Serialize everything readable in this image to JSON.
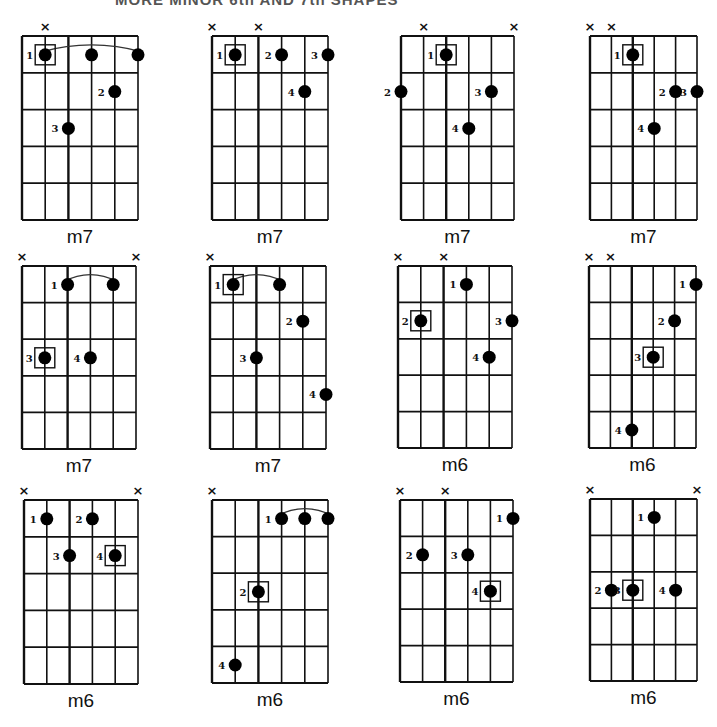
{
  "title": "MORE MINOR 6th AND 7th SHAPES",
  "layout": {
    "strings": 6,
    "frets": 5
  },
  "chords": [
    {
      "name": "m7",
      "x": 22,
      "y": 36,
      "w": 116,
      "h": 184,
      "muted": [
        1
      ],
      "notes": [
        {
          "s": 1,
          "f": 1,
          "finger": "1",
          "root": true
        },
        {
          "s": 3,
          "f": 1,
          "finger": ""
        },
        {
          "s": 5,
          "f": 1,
          "finger": ""
        },
        {
          "s": 4,
          "f": 2,
          "finger": "2"
        },
        {
          "s": 2,
          "f": 3,
          "finger": "3"
        }
      ],
      "barre": {
        "from": 1,
        "to": 5,
        "f": 1
      }
    },
    {
      "name": "m7",
      "x": 212,
      "y": 36,
      "w": 116,
      "h": 184,
      "muted": [
        0,
        2
      ],
      "notes": [
        {
          "s": 1,
          "f": 1,
          "finger": "1",
          "root": true
        },
        {
          "s": 3,
          "f": 1,
          "finger": "2"
        },
        {
          "s": 5,
          "f": 1,
          "finger": "3"
        },
        {
          "s": 4,
          "f": 2,
          "finger": "4"
        }
      ]
    },
    {
      "name": "m7",
      "x": 401,
      "y": 36,
      "w": 113,
      "h": 184,
      "muted": [
        1,
        5
      ],
      "notes": [
        {
          "s": 2,
          "f": 1,
          "finger": "1",
          "root": true
        },
        {
          "s": 0,
          "f": 2,
          "finger": "2"
        },
        {
          "s": 4,
          "f": 2,
          "finger": "3"
        },
        {
          "s": 3,
          "f": 3,
          "finger": "4"
        }
      ]
    },
    {
      "name": "m7",
      "x": 590,
      "y": 36,
      "w": 107,
      "h": 184,
      "muted": [
        0,
        1
      ],
      "notes": [
        {
          "s": 2,
          "f": 1,
          "finger": "1",
          "root": true
        },
        {
          "s": 4,
          "f": 2,
          "finger": "2"
        },
        {
          "s": 5,
          "f": 2,
          "finger": "3"
        },
        {
          "s": 3,
          "f": 3,
          "finger": "4"
        }
      ]
    },
    {
      "name": "m7",
      "x": 22,
      "y": 266,
      "w": 114,
      "h": 183,
      "muted": [
        0,
        5
      ],
      "notes": [
        {
          "s": 2,
          "f": 1,
          "finger": "1"
        },
        {
          "s": 4,
          "f": 1,
          "finger": ""
        },
        {
          "s": 1,
          "f": 3,
          "finger": "3",
          "root": true
        },
        {
          "s": 3,
          "f": 3,
          "finger": "4"
        }
      ],
      "barre": {
        "from": 2,
        "to": 4,
        "f": 1
      }
    },
    {
      "name": "m7",
      "x": 210,
      "y": 266,
      "w": 116,
      "h": 183,
      "muted": [
        0
      ],
      "notes": [
        {
          "s": 1,
          "f": 1,
          "finger": "1",
          "root": true
        },
        {
          "s": 3,
          "f": 1,
          "finger": ""
        },
        {
          "s": 4,
          "f": 2,
          "finger": "2"
        },
        {
          "s": 2,
          "f": 3,
          "finger": "3"
        },
        {
          "s": 5,
          "f": 4,
          "finger": "4"
        }
      ],
      "barre": {
        "from": 1,
        "to": 3,
        "f": 1
      }
    },
    {
      "name": "m6",
      "x": 398,
      "y": 266,
      "w": 114,
      "h": 182,
      "muted": [
        0,
        2
      ],
      "notes": [
        {
          "s": 3,
          "f": 1,
          "finger": "1"
        },
        {
          "s": 1,
          "f": 2,
          "finger": "2",
          "root": true
        },
        {
          "s": 5,
          "f": 2,
          "finger": "3"
        },
        {
          "s": 4,
          "f": 3,
          "finger": "4"
        }
      ]
    },
    {
      "name": "m6",
      "x": 589,
      "y": 266,
      "w": 107,
      "h": 182,
      "muted": [
        0,
        1
      ],
      "notes": [
        {
          "s": 5,
          "f": 1,
          "finger": "1"
        },
        {
          "s": 4,
          "f": 2,
          "finger": "2"
        },
        {
          "s": 3,
          "f": 3,
          "finger": "3",
          "root": true
        },
        {
          "s": 2,
          "f": 5,
          "finger": "4"
        }
      ]
    },
    {
      "name": "m6",
      "x": 24,
      "y": 500,
      "w": 114,
      "h": 184,
      "muted": [
        0,
        5
      ],
      "notes": [
        {
          "s": 1,
          "f": 1,
          "finger": "1"
        },
        {
          "s": 3,
          "f": 1,
          "finger": "2"
        },
        {
          "s": 2,
          "f": 2,
          "finger": "3"
        },
        {
          "s": 4,
          "f": 2,
          "finger": "4",
          "root": true
        }
      ]
    },
    {
      "name": "m6",
      "x": 212,
      "y": 500,
      "w": 116,
      "h": 183,
      "muted": [
        0
      ],
      "notes": [
        {
          "s": 3,
          "f": 1,
          "finger": "1"
        },
        {
          "s": 4,
          "f": 1,
          "finger": ""
        },
        {
          "s": 5,
          "f": 1,
          "finger": ""
        },
        {
          "s": 2,
          "f": 3,
          "finger": "2",
          "root": true
        },
        {
          "s": 1,
          "f": 5,
          "finger": "4"
        }
      ],
      "barre": {
        "from": 3,
        "to": 5,
        "f": 1
      }
    },
    {
      "name": "m6",
      "x": 400,
      "y": 500,
      "w": 113,
      "h": 182,
      "muted": [
        0,
        2
      ],
      "notes": [
        {
          "s": 5,
          "f": 1,
          "finger": "1"
        },
        {
          "s": 1,
          "f": 2,
          "finger": "2"
        },
        {
          "s": 3,
          "f": 2,
          "finger": "3"
        },
        {
          "s": 4,
          "f": 3,
          "finger": "4",
          "root": true
        }
      ]
    },
    {
      "name": "m6",
      "x": 590,
      "y": 499,
      "w": 107,
      "h": 182,
      "muted": [
        0,
        5
      ],
      "notes": [
        {
          "s": 3,
          "f": 1,
          "finger": "1"
        },
        {
          "s": 1,
          "f": 3,
          "finger": "2"
        },
        {
          "s": 2,
          "f": 3,
          "finger": "3",
          "root": true
        },
        {
          "s": 4,
          "f": 3,
          "finger": "4"
        }
      ]
    }
  ]
}
